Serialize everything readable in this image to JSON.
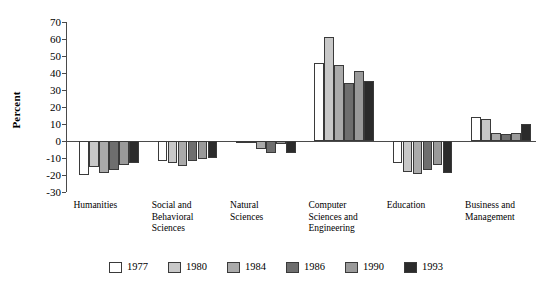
{
  "chart_data": {
    "type": "bar",
    "title": "",
    "xlabel": "",
    "ylabel": "Percent",
    "ylim": [
      -30,
      70
    ],
    "ytick_step": 10,
    "yticks": [
      "70",
      "60",
      "50",
      "40",
      "30",
      "20",
      "10",
      "0",
      "-10",
      "-20",
      "-30"
    ],
    "grid": false,
    "legend_position": "bottom",
    "categories": [
      "Humanities",
      "Social and\nBehavioral\nSciences",
      "Natural\nSciences",
      "Computer\nSciences and\nEngineering",
      "Education",
      "Business and\nManagement"
    ],
    "series": [
      {
        "name": "1977",
        "color": "#ffffff",
        "values": [
          -20.0,
          -11.5,
          -1.0,
          46.0,
          -13.0,
          14.0
        ]
      },
      {
        "name": "1980",
        "color": "#c8c8c8",
        "values": [
          -15.5,
          -13.0,
          -0.5,
          61.0,
          -18.5,
          13.0
        ]
      },
      {
        "name": "1984",
        "color": "#aaaaaa",
        "values": [
          -19.0,
          -14.5,
          -4.5,
          44.5,
          -19.5,
          5.0
        ]
      },
      {
        "name": "1986",
        "color": "#6e6e6e",
        "values": [
          -17.0,
          -11.5,
          -7.0,
          34.0,
          -17.0,
          4.0
        ]
      },
      {
        "name": "1990",
        "color": "#9a9a9a",
        "values": [
          -14.0,
          -10.5,
          -2.0,
          41.0,
          -14.0,
          5.0
        ]
      },
      {
        "name": "1993",
        "color": "#2b2b2b",
        "values": [
          -13.0,
          -10.0,
          -7.0,
          35.5,
          -19.0,
          10.0
        ]
      }
    ]
  }
}
